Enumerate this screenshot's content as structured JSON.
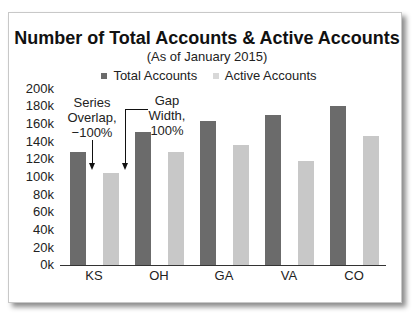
{
  "chart_data": {
    "type": "bar",
    "title": "Number of Total Accounts & Active Accounts",
    "subtitle": "(As of January 2015)",
    "xlabel": "",
    "ylabel": "",
    "categories": [
      "KS",
      "OH",
      "GA",
      "VA",
      "CO"
    ],
    "series": [
      {
        "name": "Total Accounts",
        "color": "#6b6b6b",
        "values": [
          128000,
          151000,
          164000,
          170000,
          181000
        ]
      },
      {
        "name": "Active Accounts",
        "color": "#c8c8c8",
        "values": [
          105000,
          128000,
          136000,
          118000,
          147000
        ]
      }
    ],
    "ylim": [
      0,
      200000
    ],
    "yticks": [
      "0k",
      "20k",
      "40k",
      "60k",
      "80k",
      "100k",
      "120k",
      "140k",
      "160k",
      "180k",
      "200k"
    ],
    "grid": false,
    "legend_position": "top",
    "annotations": [
      {
        "lines": [
          "Series",
          "Overlap,",
          "−100%"
        ]
      },
      {
        "lines": [
          "Gap",
          "Width,",
          "100%"
        ]
      }
    ]
  }
}
